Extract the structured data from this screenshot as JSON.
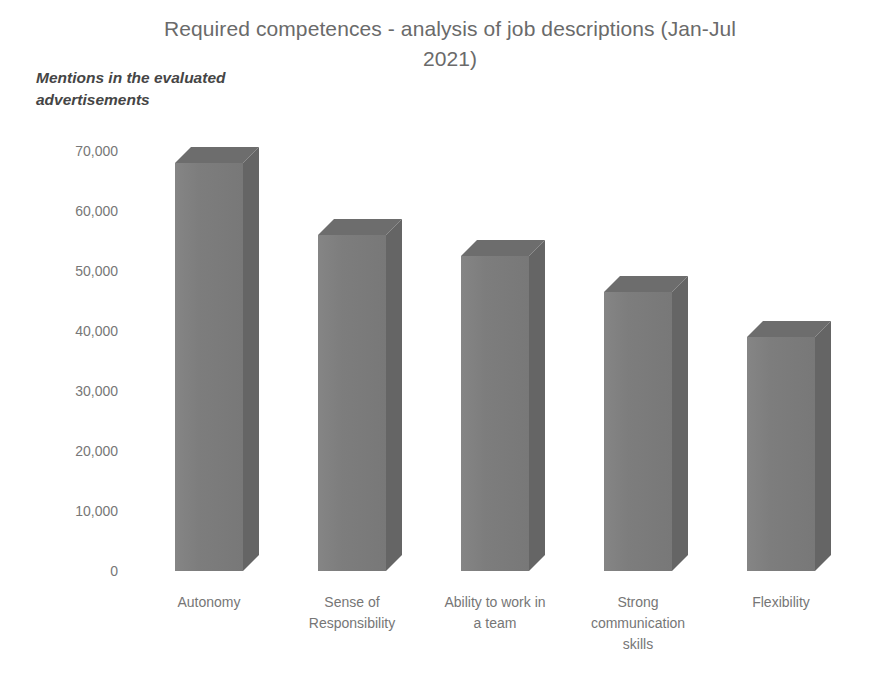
{
  "chart_data": {
    "type": "bar",
    "title": "Required competences - analysis of job descriptions (Jan-Jul 2021)",
    "title_line1": "Required competences - analysis of job descriptions (Jan-Jul",
    "title_line2": "2021)",
    "ylabel": "Mentions in the evaluated advertisements",
    "ylabel_line1": "Mentions in the evaluated",
    "ylabel_line2": "advertisements",
    "xlabel": "",
    "categories": [
      "Autonomy",
      "Sense of Responsibility",
      "Ability to work in a team",
      "Strong communication skills",
      "Flexibility"
    ],
    "category_lines": [
      [
        "Autonomy"
      ],
      [
        "Sense of",
        "Responsibility"
      ],
      [
        "Ability to work in",
        "a team"
      ],
      [
        "Strong",
        "communication",
        "skills"
      ],
      [
        "Flexibility"
      ]
    ],
    "values": [
      68000,
      56000,
      52500,
      46500,
      39000
    ],
    "ylim": [
      0,
      70000
    ],
    "ytick_values": [
      70000,
      60000,
      50000,
      40000,
      30000,
      20000,
      10000,
      0
    ],
    "ytick_labels": [
      "70,000",
      "60,000",
      "50,000",
      "40,000",
      "30,000",
      "20,000",
      "10,000",
      "0"
    ],
    "grid": false,
    "legend": "none",
    "style": "3d-column",
    "bar_color_front": "#7d7d7d",
    "bar_color_side": "#656565",
    "bar_color_top": "#6d6d6d",
    "background_color": "#ffffff",
    "text_color": "#6e6e6e"
  }
}
